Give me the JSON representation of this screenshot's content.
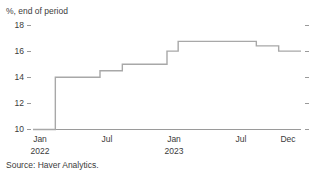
{
  "chart_data": {
    "type": "line",
    "line_style": "step-post",
    "title": "",
    "subtitle": "",
    "unit_label": "%, end of period",
    "ylabel": "",
    "xlabel": "",
    "ylim": [
      10,
      18
    ],
    "yticks": [
      10,
      12,
      14,
      16,
      18
    ],
    "ytick_labels": [
      "10",
      "12",
      "14",
      "16",
      "18"
    ],
    "grid": false,
    "legend": "none",
    "right_axis_ticks": true,
    "source": "Source: Haver Analytics.",
    "xtick_labels": [
      "Jan",
      "Jul",
      "Jan",
      "Jul",
      "Dec"
    ],
    "xtick_years": [
      "2022",
      "",
      "2023",
      "",
      ""
    ],
    "x": [
      "2022-01",
      "2022-02",
      "2022-03",
      "2022-04",
      "2022-05",
      "2022-06",
      "2022-07",
      "2022-08",
      "2022-09",
      "2022-10",
      "2022-11",
      "2022-12",
      "2023-01",
      "2023-02",
      "2023-03",
      "2023-04",
      "2023-05",
      "2023-06",
      "2023-07",
      "2023-08",
      "2023-09",
      "2023-10",
      "2023-11",
      "2023-12"
    ],
    "values": [
      10.0,
      10.0,
      14.0,
      14.0,
      14.0,
      14.0,
      14.5,
      14.5,
      15.0,
      15.0,
      15.0,
      15.0,
      16.0,
      16.75,
      16.75,
      16.75,
      16.75,
      16.75,
      16.75,
      16.75,
      16.4,
      16.4,
      16.0,
      16.0
    ],
    "series_color": "#a8a8a8",
    "axis_color": "#9a9a9a",
    "text_color": "#3b3b3b"
  }
}
